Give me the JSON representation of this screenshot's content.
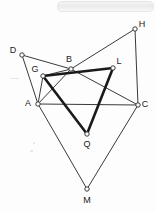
{
  "figure": {
    "background_color": "#fdfdfd",
    "stroke_color": "#3a3a3a",
    "bold_stroke_color": "#1a1a1a",
    "label_color": "#222222",
    "vertex_fill": "#ffffff",
    "thin_width": 1,
    "bold_width": 2.6,
    "points": [
      {
        "id": "D",
        "label": "D",
        "x": 22,
        "y": 55,
        "label_x": 13,
        "label_y": 51
      },
      {
        "id": "G",
        "label": "G",
        "x": 43,
        "y": 76,
        "label_x": 35,
        "label_y": 70
      },
      {
        "id": "A",
        "label": "A",
        "x": 38,
        "y": 104,
        "label_x": 28,
        "label_y": 104
      },
      {
        "id": "B",
        "label": "B",
        "x": 71,
        "y": 69,
        "label_x": 69,
        "label_y": 60
      },
      {
        "id": "L",
        "label": "L",
        "x": 113,
        "y": 68,
        "label_x": 119,
        "label_y": 62
      },
      {
        "id": "H",
        "label": "H",
        "x": 135,
        "y": 29,
        "label_x": 142,
        "label_y": 25
      },
      {
        "id": "C",
        "label": "C",
        "x": 138,
        "y": 105,
        "label_x": 145,
        "label_y": 105
      },
      {
        "id": "Q",
        "label": "Q",
        "x": 87,
        "y": 134,
        "label_x": 87,
        "label_y": 145
      },
      {
        "id": "M",
        "label": "M",
        "x": 87,
        "y": 189,
        "label_x": 87,
        "label_y": 201
      }
    ],
    "thin_edges": [
      {
        "from": "D",
        "to": "B"
      },
      {
        "from": "D",
        "to": "A"
      },
      {
        "from": "B",
        "to": "H"
      },
      {
        "from": "H",
        "to": "C"
      },
      {
        "from": "A",
        "to": "C"
      },
      {
        "from": "B",
        "to": "A"
      },
      {
        "from": "B",
        "to": "C"
      },
      {
        "from": "A",
        "to": "M"
      },
      {
        "from": "C",
        "to": "M"
      },
      {
        "from": "G",
        "to": "B"
      },
      {
        "from": "G",
        "to": "A"
      }
    ],
    "bold_edges": [
      {
        "from": "G",
        "to": "L"
      },
      {
        "from": "L",
        "to": "Q"
      },
      {
        "from": "Q",
        "to": "G"
      }
    ],
    "vertex_radius": 2.2,
    "label_font_size": 9
  }
}
